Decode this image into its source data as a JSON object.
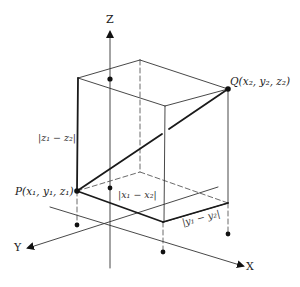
{
  "diagram": {
    "axes": {
      "x_label": "X",
      "y_label": "Y",
      "z_label": "Z"
    },
    "points": {
      "P": {
        "label": "P(x₁, y₁, z₁)"
      },
      "Q": {
        "label": "Q(x₂, y₂, z₂)"
      }
    },
    "distances": {
      "dz": "|z₁ − z₂|",
      "dx": "|x₁ − x₂|",
      "dy": "|y₁ − y₂|"
    },
    "colors": {
      "line": "#222222",
      "thin_line": "#444444",
      "background": "#ffffff"
    }
  }
}
